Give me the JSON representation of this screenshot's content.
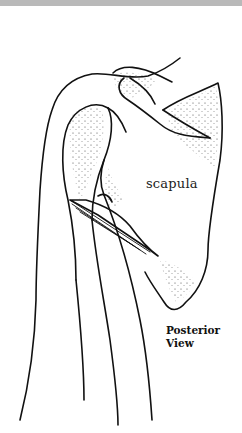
{
  "figure": {
    "labels": {
      "scapula": "scapula",
      "view_line1": "Posterior",
      "view_line2": "View"
    }
  },
  "colors": {
    "ink": "#111111",
    "stipple": "#333333",
    "background": "#ffffff",
    "topbar": "#b9b9b9"
  }
}
